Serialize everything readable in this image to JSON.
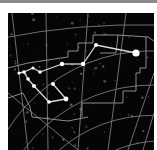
{
  "image": {
    "description": "Star chart with constellation lines and coordinate grid",
    "colors": {
      "background": "#050505",
      "grid": "#9a9a9a",
      "boundary": "#8c8c8c",
      "constellation": "#d8d8d8",
      "star": "#ffffff",
      "topbar": "#8a8a8a"
    }
  },
  "constellation": {
    "stars": [
      {
        "x": 128,
        "y": 40,
        "r": 3.6
      },
      {
        "x": 88,
        "y": 32,
        "r": 2
      },
      {
        "x": 75,
        "y": 51,
        "r": 2.2
      },
      {
        "x": 54,
        "y": 51,
        "r": 2.2
      },
      {
        "x": 32,
        "y": 59,
        "r": 1.8
      },
      {
        "x": 25,
        "y": 55,
        "r": 1.6
      },
      {
        "x": 16,
        "y": 59,
        "r": 1.8
      },
      {
        "x": 11,
        "y": 60,
        "r": 1.6
      },
      {
        "x": 20,
        "y": 66,
        "r": 1.8
      },
      {
        "x": 26,
        "y": 73,
        "r": 2
      },
      {
        "x": 41,
        "y": 89,
        "r": 1.8
      },
      {
        "x": 58,
        "y": 86,
        "r": 2.4
      },
      {
        "x": 45,
        "y": 71,
        "r": 2
      }
    ],
    "lines": [
      [
        0,
        1
      ],
      [
        1,
        2
      ],
      [
        2,
        3
      ],
      [
        3,
        4
      ],
      [
        4,
        5
      ],
      [
        5,
        6
      ],
      [
        6,
        7
      ],
      [
        6,
        8
      ],
      [
        8,
        9
      ],
      [
        9,
        10
      ],
      [
        10,
        11
      ],
      [
        11,
        12
      ]
    ]
  }
}
